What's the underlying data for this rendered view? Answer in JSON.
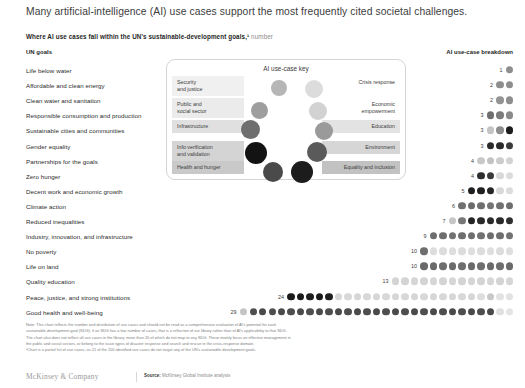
{
  "title": "Many artificial-intelligence (AI) use cases support the most frequently cited societal challenges.",
  "subtitle": "Where AI use cases fall within the UN's sustainable-development goals,¹",
  "subtitle_unit": "number",
  "column_headers": {
    "left": "UN goals",
    "right": "AI use-case breakdown"
  },
  "key": {
    "title": "AI use-case key",
    "left_items": [
      {
        "label": "Security\nand justice",
        "color": "#b6b6b6",
        "bg": "#f0f0f0"
      },
      {
        "label": "Public and\nsocial sector",
        "color": "#9e9e9e",
        "bg": "#ebebeb"
      },
      {
        "label": "Infrastructure",
        "color": "#6e6e6e",
        "bg": "#e0e0e0"
      },
      {
        "label": "Info verification\nand validation",
        "color": "#131313",
        "bg": "#d4d4d4"
      },
      {
        "label": "Health and hunger",
        "color": "#4a4a4a",
        "bg": "#c9c9c9"
      }
    ],
    "right_items": [
      {
        "label": "Crisis response",
        "color": "#dcdcdc",
        "bg": "#ffffff"
      },
      {
        "label": "Economic\nempowerment",
        "color": "#d2d2d2",
        "bg": "#ffffff"
      },
      {
        "label": "Education",
        "color": "#9a9a9a",
        "bg": "#e3e3e3"
      },
      {
        "label": "Environment",
        "color": "#5a5a5a",
        "bg": "#d6d6d6"
      },
      {
        "label": "Equality and inclusion",
        "color": "#1c1c1c",
        "bg": "#c2c2c2"
      }
    ]
  },
  "note_lines": [
    "Note: This chart reflects the number and distribution of use cases and should not be read as a comprehensive evaluation of AI's potential for each",
    "sustainable-development goal (SDG); if an SDG has a low number of cases, that is a reflection of our library rather than of AI's applicability to that SDG.",
    "The chart also does not reflect all use cases in the library; more than 20 of which do not map to any SDG. These mainly focus on effective management in",
    "the public and social sectors, or belong to the issue types of disaster response and search and rescue in the crisis-response domain.",
    "¹Chart is a partial list of use cases, as 21 of the 156 identified use cases do not target any of the UN's sustainable-development goals."
  ],
  "footer": {
    "logo": "McKinsey & Company",
    "source_label": "Source:",
    "source_value": "McKinsey Global Institute analysis"
  },
  "chart_data": {
    "type": "bar",
    "title": "Where AI use cases fall within the UN's sustainable-development goals",
    "xlabel": "number of AI use cases",
    "ylabel": "UN goals",
    "legend": [
      "Security and justice",
      "Public and social sector",
      "Infrastructure",
      "Info verification and validation",
      "Health and hunger",
      "Crisis response",
      "Economic empowerment",
      "Education",
      "Environment",
      "Equality and inclusion"
    ],
    "categories": [
      "Life below water",
      "Affordable and clean energy",
      "Clean water and sanitation",
      "Responsible consumption and production",
      "Sustainable cities and communities",
      "Gender equality",
      "Partnerships for the goals",
      "Zero hunger",
      "Decent work and economic growth",
      "Climate action",
      "Reduced inequalities",
      "Industry, innovation, and infrastructure",
      "No poverty",
      "Life on land",
      "Quality education",
      "Peace, justice, and strong institutions",
      "Good health and well-being"
    ],
    "values": [
      1,
      2,
      2,
      3,
      3,
      3,
      4,
      4,
      5,
      6,
      7,
      9,
      10,
      10,
      13,
      24,
      29
    ],
    "rows": [
      {
        "label": "Life below water",
        "count": 1,
        "dots": [
          "#8e8e8e"
        ]
      },
      {
        "label": "Affordable and clean energy",
        "count": 2,
        "dots": [
          "#8e8e8e",
          "#8e8e8e"
        ]
      },
      {
        "label": "Clean water and sanitation",
        "count": 2,
        "dots": [
          "#949494",
          "#8e8e8e"
        ]
      },
      {
        "label": "Responsible consumption and production",
        "count": 3,
        "dots": [
          "#6e6e6e",
          "#7c7c7c",
          "#8a8a8a"
        ]
      },
      {
        "label": "Sustainable cities and communities",
        "count": 3,
        "dots": [
          "#c4c4c4",
          "#8e8e8e",
          "#1c1c1c"
        ]
      },
      {
        "label": "Gender equality",
        "count": 3,
        "dots": [
          "#2a2a2a",
          "#2a2a2a",
          "#3a3a3a"
        ]
      },
      {
        "label": "Partnerships for the goals",
        "count": 4,
        "dots": [
          "#c8c8c8",
          "#c2c2c2",
          "#cccccc",
          "#d2d2d2"
        ]
      },
      {
        "label": "Zero hunger",
        "count": 4,
        "dots": [
          "#2d2d2d",
          "#3a3a3a",
          "#d8d8d8",
          "#dcdcdc"
        ]
      },
      {
        "label": "Decent work and economic growth",
        "count": 5,
        "dots": [
          "#1f1f1f",
          "#1f1f1f",
          "#252525",
          "#d8d8d8",
          "#dcdcdc"
        ]
      },
      {
        "label": "Climate action",
        "count": 6,
        "dots": [
          "#707070",
          "#6a6a6a",
          "#6e6e6e",
          "#747474",
          "#707070",
          "#6e6e6e"
        ]
      },
      {
        "label": "Reduced inequalities",
        "count": 7,
        "dots": [
          "#c6c6c6",
          "#777777",
          "#242424",
          "#2a2a2a",
          "#2a2a2a",
          "#2a2a2a",
          "#2e2e2e"
        ]
      },
      {
        "label": "Industry, innovation, and infrastructure",
        "count": 9,
        "dots": [
          "#6e6e6e",
          "#6e6e6e",
          "#727272",
          "#6e6e6e",
          "#6e6e6e",
          "#727272",
          "#6e6e6e",
          "#6e6e6e",
          "#727272"
        ]
      },
      {
        "label": "No poverty",
        "count": 10,
        "dots": [
          "#6e6e6e",
          "#dcdcdc",
          "#dcdcdc",
          "#dedede",
          "#dcdcdc",
          "#dedede",
          "#dcdcdc",
          "#dedede",
          "#dcdcdc",
          "#dedede"
        ]
      },
      {
        "label": "Life on land",
        "count": 10,
        "dots": [
          "#6a6a6a",
          "#6a6a6a",
          "#6e6e6e",
          "#6a6a6a",
          "#6e6e6e",
          "#6a6a6a",
          "#6e6e6e",
          "#6a6a6a",
          "#6e6e6e",
          "#6a6a6a"
        ]
      },
      {
        "label": "Quality education",
        "count": 13,
        "dots": [
          "#d4d4d4",
          "#d4d4d4",
          "#d6d6d6",
          "#d4d4d4",
          "#d6d6d6",
          "#d4d4d4",
          "#d6d6d6",
          "#d4d4d4",
          "#d6d6d6",
          "#d4d4d4",
          "#d6d6d6",
          "#d4d4d4",
          "#d6d6d6"
        ]
      },
      {
        "label": "Peace, justice, and strong institutions",
        "count": 24,
        "dots": [
          "#1a1a1a",
          "#1a1a1a",
          "#1e1e1e",
          "#1a1a1a",
          "#1e1e1e",
          "#d6d6d6",
          "#d8d8d8",
          "#d6d6d6",
          "#d8d8d8",
          "#d6d6d6",
          "#d8d8d8",
          "#d6d6d6",
          "#d8d8d8",
          "#d6d6d6",
          "#d8d8d8",
          "#d6d6d6",
          "#d8d8d8",
          "#d6d6d6",
          "#d8d8d8",
          "#d6d6d6",
          "#dedede",
          "#c8c8c8",
          "#e2e2e2",
          "#e2e2e2"
        ]
      },
      {
        "label": "Good health and well-being",
        "count": 29,
        "dots": [
          "#c4c4c4",
          "#4e4e4e",
          "#4a4a4a",
          "#4e4e4e",
          "#4a4a4a",
          "#4e4e4e",
          "#4a4a4a",
          "#4e4e4e",
          "#4a4a4a",
          "#4e4e4e",
          "#4a4a4a",
          "#4e4e4e",
          "#4a4a4a",
          "#4e4e4e",
          "#4a4a4a",
          "#4e4e4e",
          "#4a4a4a",
          "#4e4e4e",
          "#4a4a4a",
          "#4e4e4e",
          "#4a4a4a",
          "#4e4e4e",
          "#4a4a4a",
          "#4e4e4e",
          "#4a4a4a",
          "#4e4e4e",
          "#4a4a4a",
          "#e0e0e0",
          "#e4e4e4"
        ]
      }
    ]
  }
}
